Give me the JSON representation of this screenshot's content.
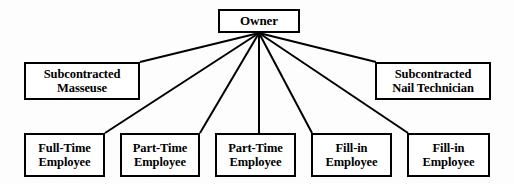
{
  "diagram": {
    "type": "organizational-hierarchy",
    "canvas": {
      "width": 514,
      "height": 184,
      "background": "#fdfdfd"
    },
    "style": {
      "box_border_color": "#000000",
      "box_border_width": 2,
      "box_fill": "#ffffff",
      "edge_color": "#000000",
      "edge_width": 2,
      "text_color": "#000000"
    },
    "fan_origin": {
      "x": 259,
      "y": 33
    },
    "root": {
      "id": "owner",
      "lines": [
        "Owner"
      ],
      "box": {
        "x": 218,
        "y": 9,
        "w": 82,
        "h": 24
      }
    },
    "mid_row": [
      {
        "id": "subcontracted-masseuse",
        "lines": [
          "Subcontracted",
          "Masseuse"
        ],
        "box": {
          "x": 24,
          "y": 62,
          "w": 116,
          "h": 38
        },
        "edge_endpoint": {
          "x": 140,
          "y": 62
        }
      },
      {
        "id": "subcontracted-nail-technician",
        "lines": [
          "Subcontracted",
          "Nail Technician"
        ],
        "box": {
          "x": 375,
          "y": 62,
          "w": 116,
          "h": 38
        },
        "edge_endpoint": {
          "x": 376,
          "y": 62
        }
      }
    ],
    "leaf_row": [
      {
        "id": "full-time-employee",
        "lines": [
          "Full-Time",
          "Employee"
        ],
        "box": {
          "x": 24,
          "y": 133,
          "w": 81,
          "h": 44
        },
        "edge_endpoint": {
          "x": 105,
          "y": 133
        }
      },
      {
        "id": "part-time-employee-1",
        "lines": [
          "Part-Time",
          "Employee"
        ],
        "box": {
          "x": 120,
          "y": 133,
          "w": 80,
          "h": 44
        },
        "edge_endpoint": {
          "x": 200,
          "y": 133
        }
      },
      {
        "id": "part-time-employee-2",
        "lines": [
          "Part-Time",
          "Employee"
        ],
        "box": {
          "x": 215,
          "y": 133,
          "w": 81,
          "h": 44
        },
        "edge_endpoint": {
          "x": 259,
          "y": 133
        }
      },
      {
        "id": "fill-in-employee-1",
        "lines": [
          "Fill-in",
          "Employee"
        ],
        "box": {
          "x": 311,
          "y": 133,
          "w": 81,
          "h": 44
        },
        "edge_endpoint": {
          "x": 312,
          "y": 133
        }
      },
      {
        "id": "fill-in-employee-2",
        "lines": [
          "Fill-in",
          "Employee"
        ],
        "box": {
          "x": 407,
          "y": 133,
          "w": 83,
          "h": 44
        },
        "edge_endpoint": {
          "x": 408,
          "y": 133
        }
      }
    ]
  }
}
